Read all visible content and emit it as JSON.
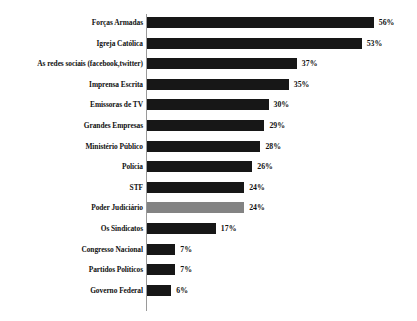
{
  "chart_data": {
    "type": "bar",
    "orientation": "horizontal",
    "title": "",
    "subtitle": "",
    "xlabel": "",
    "ylabel": "",
    "xlim": [
      0,
      60
    ],
    "grid": false,
    "legend": null,
    "value_suffix": "%",
    "categories": [
      "Forças Armadas",
      "Igreja Católica",
      "As redes sociais (facebook,twitter)",
      "Imprensa Escrita",
      "Emissoras de TV",
      "Grandes Empresas",
      "Ministério Público",
      "Polícia",
      "STF",
      "Poder Judiciário",
      "Os Sindicatos",
      "Congresso Nacional",
      "Partidos Políticos",
      "Governo Federal"
    ],
    "values": [
      56,
      53,
      37,
      35,
      30,
      29,
      28,
      26,
      24,
      24,
      17,
      7,
      7,
      6
    ],
    "value_labels": [
      "56%",
      "53%",
      "37%",
      "35%",
      "30%",
      "29%",
      "28%",
      "26%",
      "24%",
      "24%",
      "17%",
      "7%",
      "7%",
      "6%"
    ],
    "bar_colors": [
      "#171717",
      "#171717",
      "#171717",
      "#171717",
      "#171717",
      "#171717",
      "#171717",
      "#171717",
      "#171717",
      "#838383",
      "#171717",
      "#171717",
      "#171717",
      "#171717"
    ],
    "highlighted_category": "Poder Judiciário",
    "highlight_color": "#838383",
    "default_bar_color": "#171717",
    "background_color": "#ffffff",
    "axis_color": "#9a9a9a"
  }
}
